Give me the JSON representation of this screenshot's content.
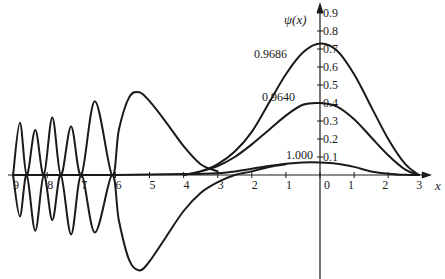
{
  "chart_data": {
    "type": "line",
    "title": "",
    "xlabel": "x",
    "ylabel": "ψ(x)",
    "xlim": [
      -9,
      3
    ],
    "ylim": [
      -0.55,
      0.95
    ],
    "grid": false,
    "legend": "none",
    "x_ticks": [
      {
        "value": -9,
        "label": "9"
      },
      {
        "value": -8,
        "label": "8"
      },
      {
        "value": -7,
        "label": "7"
      },
      {
        "value": -6,
        "label": "6"
      },
      {
        "value": -5,
        "label": "5"
      },
      {
        "value": -4,
        "label": "4"
      },
      {
        "value": -3,
        "label": "3"
      },
      {
        "value": -2,
        "label": "2"
      },
      {
        "value": -1,
        "label": "1"
      },
      {
        "value": 0,
        "label": "0"
      },
      {
        "value": 1,
        "label": "1"
      },
      {
        "value": 2,
        "label": "2"
      },
      {
        "value": 3,
        "label": "3"
      }
    ],
    "y_ticks": [
      {
        "value": 0.1,
        "label": "0.1"
      },
      {
        "value": 0.2,
        "label": "0.2"
      },
      {
        "value": 0.3,
        "label": "0.3"
      },
      {
        "value": 0.4,
        "label": "0.4"
      },
      {
        "value": 0.5,
        "label": "0.5"
      },
      {
        "value": 0.6,
        "label": "0.6"
      },
      {
        "value": 0.7,
        "label": "0.7"
      },
      {
        "value": 0.8,
        "label": "0.8"
      },
      {
        "value": 0.9,
        "label": "0.9"
      }
    ],
    "annotations": [
      {
        "text": "0.9686",
        "x": -0.3,
        "y": 0.73,
        "refers_to": "top bell curve"
      },
      {
        "text": "0.9640",
        "x": -0.3,
        "y": 0.4,
        "refers_to": "middle bell curve"
      },
      {
        "text": "1.000",
        "x": -0.3,
        "y": 0.1,
        "refers_to": "low bell curve"
      }
    ],
    "series": [
      {
        "name": "0.9686",
        "description": "tall bell curve, peak near x=0",
        "points": [
          [
            -4.0,
            0.0
          ],
          [
            -3.5,
            0.02
          ],
          [
            -3.0,
            0.06
          ],
          [
            -2.5,
            0.13
          ],
          [
            -2.0,
            0.24
          ],
          [
            -1.5,
            0.4
          ],
          [
            -1.0,
            0.56
          ],
          [
            -0.5,
            0.68
          ],
          [
            0.0,
            0.73
          ],
          [
            0.5,
            0.69
          ],
          [
            1.0,
            0.56
          ],
          [
            1.5,
            0.38
          ],
          [
            2.0,
            0.2
          ],
          [
            2.5,
            0.06
          ],
          [
            2.9,
            0.0
          ]
        ]
      },
      {
        "name": "0.9640",
        "description": "medium bell curve, peak near x=0",
        "points": [
          [
            -4.0,
            0.0
          ],
          [
            -3.5,
            0.02
          ],
          [
            -3.0,
            0.05
          ],
          [
            -2.5,
            0.1
          ],
          [
            -2.0,
            0.17
          ],
          [
            -1.5,
            0.25
          ],
          [
            -1.0,
            0.33
          ],
          [
            -0.5,
            0.39
          ],
          [
            0.0,
            0.4
          ],
          [
            0.5,
            0.38
          ],
          [
            1.0,
            0.31
          ],
          [
            1.5,
            0.21
          ],
          [
            2.0,
            0.11
          ],
          [
            2.5,
            0.03
          ],
          [
            2.9,
            0.0
          ]
        ]
      },
      {
        "name": "1.000",
        "description": "low bell curve, extends left to x=-9 near zero",
        "points": [
          [
            -9.0,
            0.0
          ],
          [
            -6.0,
            0.0
          ],
          [
            -4.0,
            0.005
          ],
          [
            -3.0,
            0.01
          ],
          [
            -2.5,
            0.02
          ],
          [
            -2.0,
            0.035
          ],
          [
            -1.5,
            0.05
          ],
          [
            -1.0,
            0.063
          ],
          [
            -0.5,
            0.07
          ],
          [
            0.0,
            0.07
          ],
          [
            0.5,
            0.063
          ],
          [
            1.0,
            0.045
          ],
          [
            1.5,
            0.02
          ],
          [
            2.0,
            0.007
          ],
          [
            2.5,
            0.001
          ],
          [
            2.9,
            0.0
          ]
        ]
      },
      {
        "name": "upper oscillating branch",
        "description": "diverging solution oscillating on left, peak near x=-5.3",
        "points": [
          [
            -9.0,
            0.0
          ],
          [
            -8.8,
            0.29
          ],
          [
            -8.6,
            0.0
          ],
          [
            -8.35,
            0.25
          ],
          [
            -8.1,
            0.0
          ],
          [
            -7.85,
            0.32
          ],
          [
            -7.6,
            0.0
          ],
          [
            -7.3,
            0.27
          ],
          [
            -7.0,
            0.0
          ],
          [
            -6.6,
            0.41
          ],
          [
            -6.1,
            0.0
          ],
          [
            -5.9,
            0.25
          ],
          [
            -5.6,
            0.43
          ],
          [
            -5.3,
            0.46
          ],
          [
            -5.0,
            0.41
          ],
          [
            -4.5,
            0.29
          ],
          [
            -4.0,
            0.16
          ],
          [
            -3.5,
            0.06
          ],
          [
            -3.0,
            0.02
          ]
        ]
      },
      {
        "name": "lower oscillating branch",
        "description": "mirror diverging solution, trough near x=-5.3",
        "points": [
          [
            -9.0,
            0.0
          ],
          [
            -8.8,
            -0.23
          ],
          [
            -8.6,
            0.0
          ],
          [
            -8.35,
            -0.31
          ],
          [
            -8.1,
            0.0
          ],
          [
            -7.85,
            -0.25
          ],
          [
            -7.6,
            0.0
          ],
          [
            -7.3,
            -0.33
          ],
          [
            -7.0,
            0.0
          ],
          [
            -6.6,
            -0.32
          ],
          [
            -6.1,
            0.0
          ],
          [
            -5.9,
            -0.25
          ],
          [
            -5.6,
            -0.47
          ],
          [
            -5.3,
            -0.53
          ],
          [
            -5.0,
            -0.48
          ],
          [
            -4.5,
            -0.34
          ],
          [
            -4.0,
            -0.2
          ],
          [
            -3.5,
            -0.1
          ],
          [
            -3.0,
            -0.04
          ],
          [
            -2.5,
            0.0
          ],
          [
            -2.0,
            0.02
          ],
          [
            -1.5,
            0.045
          ],
          [
            -1.0,
            0.06
          ]
        ]
      }
    ]
  },
  "geometry": {
    "origin_x_px": 320,
    "origin_y_px": 175,
    "px_per_x_unit": 34.1,
    "px_per_y_unit": 180
  }
}
